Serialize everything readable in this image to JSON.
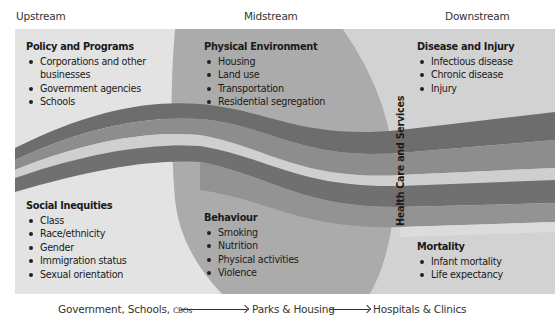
{
  "stages": {
    "upstream": "Upstream",
    "midstream": "Midstream",
    "downstream": "Downstream"
  },
  "boxes": {
    "policy": {
      "title": "Policy and Programs",
      "items": [
        "Corporations and other businesses",
        "Government agencies",
        "Schools"
      ]
    },
    "physical": {
      "title": "Physical Environment",
      "items": [
        "Housing",
        "Land use",
        "Transportation",
        "Residential segregation"
      ]
    },
    "disease": {
      "title": "Disease and Injury",
      "items": [
        "Infectious disease",
        "Chronic disease",
        "Injury"
      ]
    },
    "social": {
      "title": "Social Inequities",
      "items": [
        "Class",
        "Race/ethnicity",
        "Gender",
        "Immigration status",
        "Sexual orientation"
      ]
    },
    "behaviour": {
      "title": "Behaviour",
      "items": [
        "Smoking",
        "Nutrition",
        "Physical activities",
        "Violence"
      ]
    },
    "mortality": {
      "title": "Mortality",
      "items": [
        "Infant mortality",
        "Life expectancy"
      ]
    }
  },
  "health_care_label": "Health Care and Services",
  "bottom_flow": {
    "upstream": "Government, Schools, ",
    "upstream_small": "CBOs",
    "midstream": "Parks & Housing",
    "downstream": "Hospitals & Clinics"
  },
  "colors": {
    "panel_bg": "#e2e2e2",
    "mid_lens": "#a9a9a9",
    "right_lens": "#cfcfcf",
    "band_dark": "#6e6e6e",
    "band_mid": "#8c8c8c",
    "band_light": "#c8c8c8"
  }
}
